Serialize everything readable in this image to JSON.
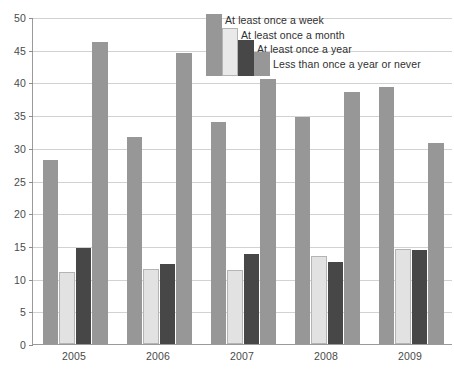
{
  "chart_data": {
    "type": "bar",
    "title": "",
    "subtitle": "",
    "xlabel": "",
    "ylabel": "",
    "categories": [
      "2005",
      "2006",
      "2007",
      "2008",
      "2009"
    ],
    "ylim": [
      0,
      50
    ],
    "ytick_labels": [
      "0",
      "5",
      "10",
      "15",
      "20",
      "25",
      "30",
      "35",
      "40",
      "45",
      "50"
    ],
    "ytick_values": [
      0,
      5,
      10,
      15,
      20,
      25,
      30,
      35,
      40,
      45,
      50
    ],
    "grid": true,
    "legend_position": "top-right",
    "series": [
      {
        "name": "At least once a week",
        "color": "#979797",
        "values": [
          28.1,
          31.7,
          33.9,
          34.7,
          39.3
        ]
      },
      {
        "name": "At least once a month",
        "color": "#e2e2e2",
        "values": [
          11.0,
          11.5,
          11.3,
          13.4,
          14.6
        ]
      },
      {
        "name": "At least once a year",
        "color": "#474747",
        "values": [
          14.7,
          12.3,
          13.7,
          12.5,
          14.4
        ]
      },
      {
        "name": "Less than once a year or never",
        "color": "#979797",
        "values": [
          46.2,
          44.5,
          40.5,
          38.6,
          30.8
        ]
      }
    ]
  },
  "legend": {
    "items": [
      "At least once a week",
      "At least once a month",
      "At least once a year",
      "Less than once a year or never"
    ]
  },
  "axis": {
    "y_labels": [
      "50",
      "45",
      "40",
      "35",
      "30",
      "25",
      "20",
      "15",
      "10",
      "5",
      "0"
    ],
    "x_labels": [
      "2005",
      "2006",
      "2007",
      "2008",
      "2009"
    ]
  },
  "colors": {
    "series_a": "#979797",
    "series_b": "#e2e2e2",
    "series_c": "#474747",
    "series_d": "#979797",
    "grid": "#d2d2d2",
    "axis": "#9a9a9a",
    "text": "#4a4a4a"
  }
}
